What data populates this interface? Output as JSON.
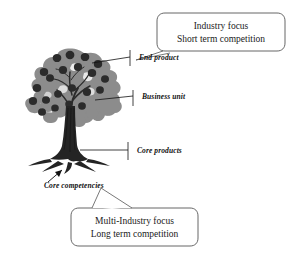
{
  "diagram": {
    "background_color": "#ffffff",
    "line_color": "#111111",
    "canopy_color": "#8c8c8c",
    "fruit_color": "#2b2b2b",
    "trunk_color": "#242424"
  },
  "tree": {
    "name": "core-competency-tree",
    "parts": {
      "canopy": "canopy-foliage",
      "fruits": "fruit-end-products",
      "branches": "branches-business-units",
      "trunk": "trunk-core-products",
      "roots": "roots-core-competencies"
    }
  },
  "labels": [
    {
      "id": "end-product",
      "text": "End product"
    },
    {
      "id": "business-unit",
      "text": "Business unit"
    },
    {
      "id": "core-products",
      "text": "Core products"
    },
    {
      "id": "core-competencies",
      "text": "Core competencies"
    }
  ],
  "callouts": {
    "top": {
      "id": "callout-industry-focus",
      "line1": "Industry focus",
      "line2": "Short term competition"
    },
    "bottom": {
      "id": "callout-multi-industry-focus",
      "line1": "Multi-Industry focus",
      "line2": "Long term competition"
    }
  }
}
